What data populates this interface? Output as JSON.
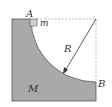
{
  "diagram": {
    "type": "physics-mechanics",
    "labels": {
      "point_a": "A",
      "point_b": "B",
      "small_mass": "m",
      "large_mass": "M",
      "radius": "R"
    },
    "colors": {
      "block_fill": "#a9a9a9",
      "block_stroke": "#555555",
      "small_block_fill": "#cfcfcf",
      "dashed_line": "#9a9a9a",
      "arrow": "#333333"
    }
  }
}
